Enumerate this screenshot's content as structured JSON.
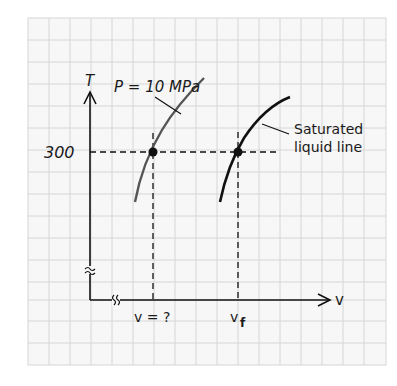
{
  "diagram": {
    "axes": {
      "y_label": "T",
      "x_label": "v",
      "y_tick": "300",
      "break_symbol": "≈"
    },
    "curves": [
      {
        "name": "isobar",
        "label": "P = 10 MPa",
        "color": "#555555"
      },
      {
        "name": "saturated-liquid-line",
        "label_line1": "Saturated",
        "label_line2": "liquid line",
        "color": "#111111"
      }
    ],
    "markers": {
      "v_unknown": "v = ?",
      "v_f": "v",
      "v_f_sub": "f"
    },
    "colors": {
      "grid": "#d4d4d4",
      "ink": "#111111",
      "isobar": "#555555",
      "background": "#f6f6f6"
    }
  }
}
